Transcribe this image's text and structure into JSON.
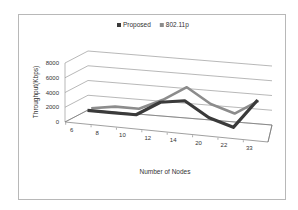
{
  "chart_data": {
    "type": "line",
    "subtype": "3d-line",
    "title": "",
    "xlabel": "Number of Nodes",
    "ylabel": "Throughput(Kbps)",
    "categories": [
      "6",
      "8",
      "10",
      "12",
      "14",
      "20",
      "22",
      "33"
    ],
    "ylim": [
      0,
      8000
    ],
    "yticks": [
      "0",
      "2000",
      "4000",
      "6000",
      "8000"
    ],
    "ytick_values": [
      0,
      2000,
      4000,
      6000,
      8000
    ],
    "grid": true,
    "legend_position": "top",
    "series": [
      {
        "name": "Proposed",
        "color": "#3a3a3a",
        "values": [
          1000,
          1000,
          1000,
          3000,
          3500,
          1500,
          500,
          4500
        ]
      },
      {
        "name": "802.11p",
        "color": "#8c8c8c",
        "values": [
          1000,
          1500,
          1500,
          3000,
          5000,
          3000,
          2000,
          4000
        ]
      }
    ]
  }
}
